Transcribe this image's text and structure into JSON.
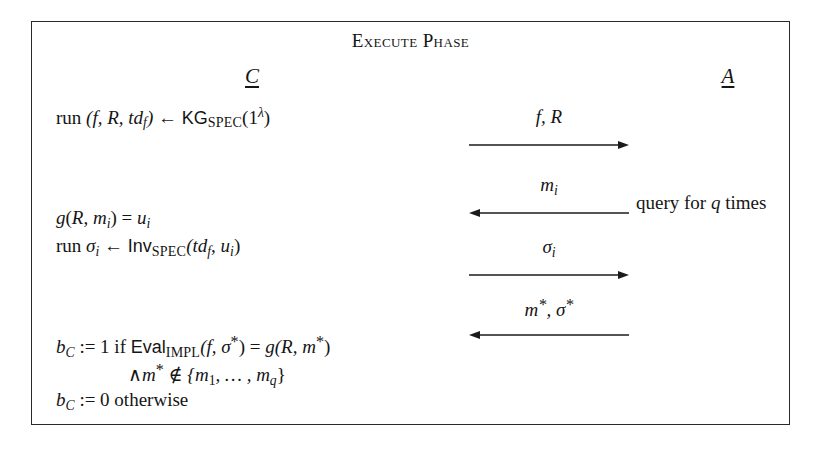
{
  "diagram": {
    "title": "Execute Phase",
    "parties": {
      "left": {
        "symbol": "C",
        "role": "challenger"
      },
      "right": {
        "symbol": "A",
        "role": "adversary"
      }
    },
    "statements": {
      "keygen": {
        "prefix": "run ",
        "tuple": "(f, R, td",
        "tuple_sub": "f",
        "tuple_close": ")",
        "arrow": "←",
        "algorithm": "KG",
        "algorithm_sub": "SPEC",
        "argument_open": "(1",
        "argument_sup": "λ",
        "argument_close": ")"
      },
      "eval_g": {
        "fn": "g",
        "open": "(",
        "arg1": "R",
        "comma": ", ",
        "arg2": "m",
        "arg2_sub": "i",
        "close": ")",
        "equals": " = ",
        "result": "u",
        "result_sub": "i"
      },
      "invert": {
        "prefix": "run ",
        "output": "σ",
        "output_sub": "i",
        "arrow": "←",
        "algorithm": "Inv",
        "algorithm_sub": "SPEC",
        "args": "(td",
        "args_sub": "f",
        "args_mid": ", u",
        "args_sub2": "i",
        "args_close": ")"
      },
      "verify_one": {
        "bit": "b",
        "bit_sub": "C",
        "assign": " := 1 if ",
        "algorithm": "Eval",
        "algorithm_sub": "IMPL",
        "args_open": "(f, σ",
        "star": "*",
        "args_close": ")",
        "equals": " = ",
        "rhs_fn": "g",
        "rhs_open": "(R, m",
        "rhs_star": "*",
        "rhs_close": ")"
      },
      "freshness": {
        "wedge": "∧",
        "msg": "m",
        "star": "*",
        "notin": " ∉ ",
        "set_open": "{m",
        "set_sub1": "1",
        "set_mid": ", … , m",
        "set_sub2": "q",
        "set_close": "}"
      },
      "verify_zero": {
        "bit": "b",
        "bit_sub": "C",
        "assign": " := 0 otherwise"
      }
    },
    "messages": [
      {
        "id": "f-R",
        "label_main": "f, R",
        "direction": "right",
        "from": "challenger",
        "to": "adversary"
      },
      {
        "id": "m-i",
        "label_main": "m",
        "label_sub": "i",
        "direction": "left",
        "from": "adversary",
        "to": "challenger",
        "note": "query for q times"
      },
      {
        "id": "sigma-i",
        "label_main": "σ",
        "label_sub": "i",
        "direction": "right",
        "from": "challenger",
        "to": "adversary"
      },
      {
        "id": "forgery",
        "label_main": "m",
        "label_star": "*",
        "label_rest": ", σ",
        "label_star2": "*",
        "direction": "left",
        "from": "adversary",
        "to": "challenger"
      }
    ],
    "annotations": {
      "query_note_prefix": "query for ",
      "query_note_var": "q",
      "query_note_suffix": " times"
    },
    "colors": {
      "ink": "#151515",
      "border": "#2a2a2a",
      "background": "#ffffff"
    }
  }
}
